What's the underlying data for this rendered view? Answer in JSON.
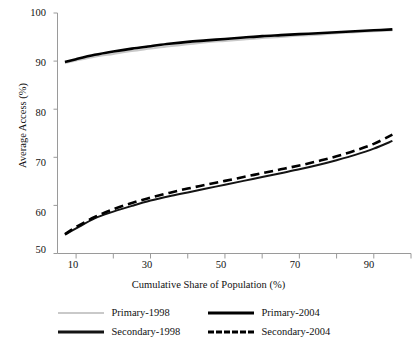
{
  "chart_data": {
    "type": "line",
    "title": "",
    "xlabel": "Cumulative Share of Population (%)",
    "ylabel": "Average Access (%)",
    "xlim": [
      5,
      100
    ],
    "ylim": [
      50,
      100
    ],
    "xticks": [
      10,
      30,
      50,
      70,
      90
    ],
    "xticks_all": [
      10,
      20,
      30,
      40,
      50,
      60,
      70,
      80,
      90,
      100
    ],
    "yticks": [
      50,
      60,
      70,
      80,
      90,
      100
    ],
    "grid": false,
    "legend_position": "bottom",
    "x": [
      7,
      10,
      15,
      20,
      25,
      30,
      35,
      40,
      45,
      50,
      55,
      60,
      65,
      70,
      75,
      80,
      85,
      90,
      95
    ],
    "series": [
      {
        "name": "Primary-1998",
        "color": "#c9c9c9",
        "style": "solid",
        "width": 2,
        "values": [
          89.6,
          90.1,
          90.9,
          91.5,
          92.1,
          92.6,
          93.1,
          93.5,
          93.9,
          94.2,
          94.5,
          94.8,
          95.0,
          95.3,
          95.5,
          95.8,
          96.0,
          96.2,
          96.4
        ]
      },
      {
        "name": "Primary-2004",
        "color": "#000000",
        "style": "solid",
        "width": 2.6,
        "values": [
          89.8,
          90.4,
          91.3,
          92.0,
          92.6,
          93.1,
          93.6,
          94.0,
          94.3,
          94.6,
          94.9,
          95.2,
          95.4,
          95.6,
          95.8,
          96.0,
          96.2,
          96.4,
          96.6
        ]
      },
      {
        "name": "Secondary-1998",
        "color": "#141414",
        "style": "solid",
        "width": 2,
        "values": [
          53.9,
          55.2,
          57.3,
          58.7,
          59.9,
          61.0,
          61.9,
          62.7,
          63.5,
          64.3,
          65.1,
          65.9,
          66.7,
          67.5,
          68.4,
          69.4,
          70.5,
          71.8,
          73.4
        ]
      },
      {
        "name": "Secondary-2004",
        "color": "#000000",
        "style": "dashed",
        "width": 2.6,
        "values": [
          54.0,
          55.5,
          57.6,
          59.2,
          60.5,
          61.6,
          62.6,
          63.5,
          64.3,
          65.1,
          65.9,
          66.7,
          67.5,
          68.3,
          69.2,
          70.2,
          71.4,
          72.8,
          74.7
        ]
      }
    ]
  },
  "axes": {
    "ylabel": "Average Access (%)",
    "xlabel": "Cumulative Share of Population (%)",
    "ytick_labels": [
      "100",
      "90",
      "80",
      "70",
      "60",
      "50"
    ],
    "xtick_labels": [
      "10",
      "30",
      "50",
      "70",
      "90"
    ]
  },
  "legend": {
    "row1": [
      {
        "label": "Primary-1998",
        "swatch": "line-solid-gray"
      },
      {
        "label": "Primary-2004",
        "swatch": "line-solid-black"
      }
    ],
    "row2": [
      {
        "label": "Secondary-1998",
        "swatch": "line-solid-black-thin"
      },
      {
        "label": "Secondary-2004",
        "swatch": "line-dashed-black"
      }
    ]
  },
  "title": {
    "text": ""
  }
}
